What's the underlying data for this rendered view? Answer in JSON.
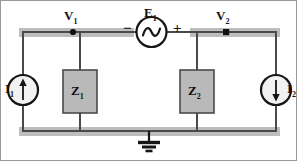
{
  "figure": {
    "type": "schematic",
    "colors": {
      "wire": "#4a4a4a",
      "rail_shadow": "#bdbdbd",
      "impedance_fill": "#b9b9b9",
      "impedance_stroke": "#4a4a4a",
      "symbol_stroke": "#161616",
      "node_dot": "#111111",
      "text": "#131313",
      "frame": "#9a9a9a",
      "background": "#ffffff"
    }
  },
  "labels": {
    "v1": {
      "base": "V",
      "sub": "1"
    },
    "v2": {
      "base": "V",
      "sub": "2"
    },
    "e1": {
      "base": "E",
      "sub": "1"
    },
    "i1": {
      "base": "I",
      "sub": "1"
    },
    "i2": {
      "base": "I",
      "sub": "2"
    },
    "z1": {
      "base": "Z",
      "sub": "1"
    },
    "z2": {
      "base": "Z",
      "sub": "2"
    },
    "minus": "−",
    "plus": "+"
  },
  "components": {
    "source_e1": {
      "name": "ac-voltage-source",
      "symbol": "sine-wave-in-circle",
      "polarity_left": "−",
      "polarity_right": "+"
    },
    "source_i1": {
      "name": "current-source-left",
      "symbol": "arrow-in-circle",
      "direction": "up"
    },
    "source_i2": {
      "name": "current-source-right",
      "symbol": "arrow-in-circle",
      "direction": "down"
    },
    "impedance_z1": {
      "name": "impedance-block-left",
      "symbol": "filled-rectangle"
    },
    "impedance_z2": {
      "name": "impedance-block-right",
      "symbol": "filled-rectangle"
    },
    "ground": {
      "name": "ground-symbol",
      "symbol": "earth-ground-three-bars"
    }
  },
  "nodes": [
    {
      "name": "node-v1",
      "label": "V1"
    },
    {
      "name": "node-v2",
      "label": "V2"
    }
  ]
}
